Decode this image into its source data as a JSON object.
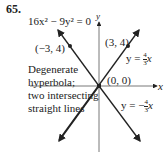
{
  "problem_number": "65.",
  "equation": "16x² − 9y² = 0",
  "axes": {
    "x_label": "x",
    "y_label": "y"
  },
  "points": [
    {
      "label": "(−3, 4)",
      "x": -3,
      "y": 4
    },
    {
      "label": "(3, 4)",
      "x": 3,
      "y": 4
    },
    {
      "label": "(0, 0)",
      "x": 0,
      "y": 0
    }
  ],
  "lines": [
    {
      "label_prefix": "y = ",
      "num": "4",
      "den": "3",
      "suffix": "x"
    },
    {
      "label_prefix": "y = −",
      "num": "4",
      "den": "3",
      "suffix": "x"
    }
  ],
  "description": [
    "Degenerate",
    "hyperbola;",
    "two intersecting",
    "straight lines"
  ]
}
